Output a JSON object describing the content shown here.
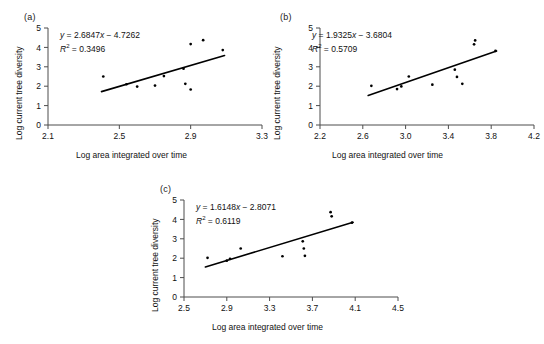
{
  "figure": {
    "background": "#ffffff",
    "ink": "#111111",
    "axis_color": "#4d4d4d",
    "point_color": "#000000",
    "line_color": "#000000"
  },
  "common": {
    "xlabel": "Log area integrated over time",
    "ylabel": "Log current tree diversity",
    "yticks": [
      "0",
      "1",
      "2",
      "3",
      "4",
      "5"
    ],
    "ylim": [
      0,
      5
    ]
  },
  "chart_data": [
    {
      "type": "scatter",
      "panel": "(a)",
      "title": "",
      "xlabel": "Log area integrated over time",
      "ylabel": "Log current tree diversity",
      "xlim": [
        2.1,
        3.3
      ],
      "ylim": [
        0,
        5
      ],
      "xticks": [
        2.1,
        2.5,
        2.9,
        3.3
      ],
      "xtick_labels": [
        "2.1",
        "2.5",
        "2.9",
        "3.3"
      ],
      "yticks": [
        0,
        1,
        2,
        3,
        4,
        5
      ],
      "ytick_labels": [
        "0",
        "1",
        "2",
        "3",
        "4",
        "5"
      ],
      "grid": false,
      "legend": "none",
      "annotation_equation": "y = 2.6847x − 4.7262",
      "annotation_r2": "R² = 0.3496",
      "slope": 2.6847,
      "intercept": -4.7262,
      "r2": 0.3496,
      "points": [
        {
          "x": 2.41,
          "y": 2.5
        },
        {
          "x": 2.54,
          "y": 2.1
        },
        {
          "x": 2.6,
          "y": 1.98
        },
        {
          "x": 2.7,
          "y": 2.03
        },
        {
          "x": 2.75,
          "y": 2.52
        },
        {
          "x": 2.86,
          "y": 2.9
        },
        {
          "x": 2.87,
          "y": 2.12
        },
        {
          "x": 2.9,
          "y": 4.17
        },
        {
          "x": 2.9,
          "y": 1.83
        },
        {
          "x": 2.97,
          "y": 4.37
        },
        {
          "x": 3.08,
          "y": 3.86
        }
      ],
      "fit_line": {
        "x_start": 2.4,
        "x_end": 3.09,
        "y_start": 1.72,
        "y_end": 3.58
      }
    },
    {
      "type": "scatter",
      "panel": "(b)",
      "title": "",
      "xlabel": "Log area integrated over time",
      "ylabel": "Log current tree diversity",
      "xlim": [
        2.2,
        4.2
      ],
      "ylim": [
        0,
        5
      ],
      "xticks": [
        2.2,
        2.6,
        3.0,
        3.4,
        3.8,
        4.2
      ],
      "xtick_labels": [
        "2.2",
        "2.6",
        "3.0",
        "3.4",
        "3.8",
        "4.2"
      ],
      "yticks": [
        0,
        1,
        2,
        3,
        4,
        5
      ],
      "ytick_labels": [
        "0",
        "1",
        "2",
        "3",
        "4",
        "5"
      ],
      "grid": false,
      "legend": "none",
      "annotation_equation": "y = 1.9325x − 3.6804",
      "annotation_r2": "R² = 0.5709",
      "slope": 1.9325,
      "intercept": -3.6804,
      "r2": 0.5709,
      "points": [
        {
          "x": 2.68,
          "y": 2.02
        },
        {
          "x": 2.92,
          "y": 1.85
        },
        {
          "x": 2.96,
          "y": 1.99
        },
        {
          "x": 3.03,
          "y": 2.5
        },
        {
          "x": 3.25,
          "y": 2.08
        },
        {
          "x": 3.46,
          "y": 2.85
        },
        {
          "x": 3.48,
          "y": 2.48
        },
        {
          "x": 3.53,
          "y": 2.12
        },
        {
          "x": 3.64,
          "y": 4.16
        },
        {
          "x": 3.65,
          "y": 4.36
        },
        {
          "x": 3.84,
          "y": 3.82
        }
      ],
      "fit_line": {
        "x_start": 2.65,
        "x_end": 3.85,
        "y_start": 1.52,
        "y_end": 3.82
      }
    },
    {
      "type": "scatter",
      "panel": "(c)",
      "title": "",
      "xlabel": "Log area integrated over time",
      "ylabel": "Log current tree diversity",
      "xlim": [
        2.5,
        4.5
      ],
      "ylim": [
        0,
        5
      ],
      "xticks": [
        2.5,
        2.9,
        3.3,
        3.7,
        4.1,
        4.5
      ],
      "xtick_labels": [
        "2.5",
        "2.9",
        "3.3",
        "3.7",
        "4.1",
        "4.5"
      ],
      "yticks": [
        0,
        1,
        2,
        3,
        4,
        5
      ],
      "ytick_labels": [
        "0",
        "1",
        "2",
        "3",
        "4",
        "5"
      ],
      "grid": false,
      "legend": "none",
      "annotation_equation": "y = 1.6148x − 2.8071",
      "annotation_r2": "R² = 0.6119",
      "slope": 1.6148,
      "intercept": -2.8071,
      "r2": 0.6119,
      "points": [
        {
          "x": 2.72,
          "y": 2.02
        },
        {
          "x": 2.9,
          "y": 1.87
        },
        {
          "x": 2.93,
          "y": 1.97
        },
        {
          "x": 3.03,
          "y": 2.5
        },
        {
          "x": 3.42,
          "y": 2.1
        },
        {
          "x": 3.61,
          "y": 2.87
        },
        {
          "x": 3.62,
          "y": 2.5
        },
        {
          "x": 3.63,
          "y": 2.12
        },
        {
          "x": 3.87,
          "y": 4.37
        },
        {
          "x": 3.88,
          "y": 4.16
        },
        {
          "x": 4.07,
          "y": 3.83
        }
      ],
      "fit_line": {
        "x_start": 2.7,
        "x_end": 4.08,
        "y_start": 1.55,
        "y_end": 3.85
      }
    }
  ]
}
